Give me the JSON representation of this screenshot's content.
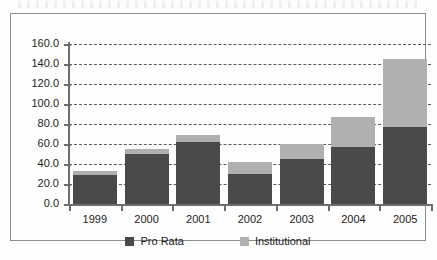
{
  "chart_data": {
    "type": "bar",
    "subtype": "stacked-bar",
    "title": "",
    "subtitle": "",
    "xlabel": "",
    "ylabel": "",
    "categories": [
      "1999",
      "2000",
      "2001",
      "2002",
      "2003",
      "2004",
      "2005"
    ],
    "series": [
      {
        "name": "Pro Rata",
        "color": "#4a4a4a",
        "values": [
          29,
          50,
          62,
          30,
          45,
          57,
          77
        ]
      },
      {
        "name": "Institutional",
        "color": "#b0b0b0",
        "values": [
          4,
          5,
          7,
          12,
          15,
          30,
          68
        ]
      }
    ],
    "totals": [
      33,
      55,
      69,
      42,
      60,
      87,
      145
    ],
    "ylim": [
      0,
      160
    ],
    "ytick_step": 20,
    "ytick_labels": [
      "0.0",
      "20.0",
      "40.0",
      "60.0",
      "80.0",
      "100.0",
      "120.0",
      "140.0",
      "160.0"
    ],
    "ytick_values": [
      0,
      20,
      40,
      60,
      80,
      100,
      120,
      140,
      160
    ],
    "grid": true,
    "grid_style": "dashed",
    "grid_axis": "y",
    "legend_position": "bottom",
    "legend": [
      "Pro Rata",
      "Institutional"
    ],
    "annotations": []
  },
  "colors": {
    "pro_rata": "#4a4a4a",
    "institutional": "#b0b0b0",
    "axis": "#6e6e6e",
    "grid": "#5b5b5b",
    "frame": "#8d8d8d",
    "text": "#1c1c1c",
    "background": "#fdfdfd"
  }
}
